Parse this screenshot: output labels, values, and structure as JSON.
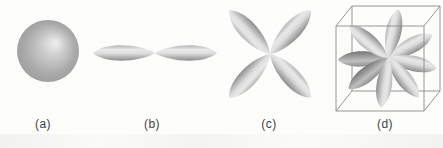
{
  "figure": {
    "panels": [
      {
        "id": "a",
        "label": "(a)",
        "shape": "sphere"
      },
      {
        "id": "b",
        "label": "(b)",
        "shape": "dumbbell-two-lobes"
      },
      {
        "id": "c",
        "label": "(c)",
        "shape": "clover-four-lobes"
      },
      {
        "id": "d",
        "label": "(d)",
        "shape": "cube-eight-lobes"
      }
    ]
  },
  "colors": {
    "background": "#fdfdfc",
    "lobe_highlight": "#e8e8e8",
    "lobe_shadow": "#8c8c8c",
    "lobe_back_shadow": "#757575",
    "sphere_base": "#a0a0a0",
    "sphere_highlight": "#f0f0f0",
    "wireframe": "#8a8a8a",
    "label_text": "#3f3f3f"
  }
}
